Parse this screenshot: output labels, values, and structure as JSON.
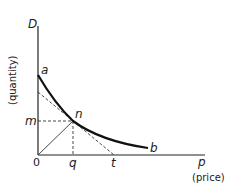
{
  "diagram": {
    "y_axis": {
      "symbol": "D",
      "label": "(quantity)"
    },
    "x_axis": {
      "symbol": "p",
      "label": "(price)"
    },
    "origin_label": "0",
    "points": {
      "a": "a",
      "n": "n",
      "b": "b",
      "m": "m",
      "q": "q",
      "t": "t"
    },
    "colors": {
      "curve": "#111111",
      "axis": "#222222",
      "dashed": "#333333"
    }
  }
}
